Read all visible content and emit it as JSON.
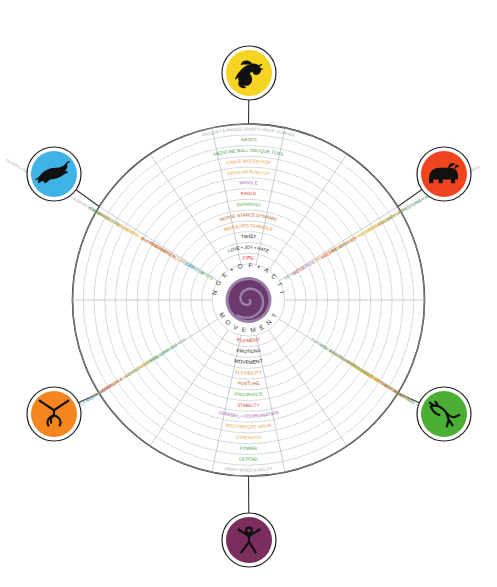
{
  "hub": {
    "top_text": "R A N G E  •  O F  •  A C T I V E",
    "bottom_text": "M O V E M E N T",
    "spiral_color": "#6b3a6b",
    "spiral_outer_color": "#9a7fa8"
  },
  "colors": {
    "grey": "#9aa6ae",
    "green": "#4f9c4f",
    "orange": "#e8a33d",
    "orange_dark": "#e08a2e",
    "purple": "#9b59b6",
    "red": "#d93b2b",
    "green_mid": "#5bb85b",
    "brown": "#b5651d",
    "black": "#222222",
    "yellow": "#e8c83d",
    "teal": "#4aa3a3",
    "blue": "#3d9bd9",
    "ring_line": "#b9c3cc"
  },
  "rings": [
    {
      "index": 0,
      "top": "RACQUET & PADDLE SPORTS • ROCK CLIMBING",
      "bottom": "SPORT SPEED & AGILITY",
      "color": "#9aa6ae",
      "size": 4.0
    },
    {
      "index": 1,
      "top": "AIKIDO",
      "bottom": "DEFEND",
      "color": "#4f9c4f",
      "size": 4.6
    },
    {
      "index": 2,
      "top": "MEDICINE BALL OBLIQUE TOSS",
      "bottom": "POWER",
      "color": "#4f9c4f",
      "size": 4.6
    },
    {
      "index": 3,
      "top": "CABLE WOODCHOP",
      "bottom": "STRENGTH",
      "color": "#e8a33d",
      "size": 4.6
    },
    {
      "index": 4,
      "top": "DRAGON PUSH UP",
      "bottom": "BODYWEIGHT NINJA",
      "color": "#e8a33d",
      "size": 4.6
    },
    {
      "index": 5,
      "top": "WIGGLE",
      "bottom": "CEREBEL • COORDINATION",
      "color": "#9b59b6",
      "size": 4.6
    },
    {
      "index": 6,
      "top": "EAGLE",
      "bottom": "STABILITY",
      "color": "#d93b2b",
      "size": 4.6
    },
    {
      "index": 7,
      "top": "SWIMMING",
      "bottom": "ENDURANCE",
      "color": "#5bb85b",
      "size": 4.6
    },
    {
      "index": 8,
      "top": "HORSE STANCE DYNAMIC",
      "bottom": "POSTURE",
      "color": "#b5651d",
      "size": 4.6
    },
    {
      "index": 9,
      "top": "REVOLVED TRIANGLE",
      "bottom": "FLEXIBILITY",
      "color": "#e08a2e",
      "size": 4.6
    },
    {
      "index": 10,
      "top": "TWIST",
      "bottom": "MOVEMENT",
      "color": "#222222",
      "size": 5.0
    },
    {
      "index": 11,
      "top": "LOVE • JOY • HATE",
      "bottom": "EMOTIONS",
      "color": "#222222",
      "size": 4.6
    },
    {
      "index": 12,
      "top": "FIRE",
      "bottom": "ELEMENT",
      "color": "#d93b2b",
      "size": 5.0
    }
  ],
  "left_spokes": [
    {
      "label": "OLYMPIC / POWER LIFTING • RIFLE SKILLS • JUMPING SPORTS",
      "color": "#9aa6ae"
    },
    {
      "label": "KEY MOVES",
      "color": "#4f9c4f"
    },
    {
      "label": "CLEAN & JERK",
      "color": "#4f9c4f"
    },
    {
      "label": "BARBELL SQUAT",
      "color": "#e8a33d"
    },
    {
      "label": "TUCK JUMPS",
      "color": "#e8a33d"
    },
    {
      "label": "SIDE PLANK",
      "color": "#e8c83d"
    },
    {
      "label": "BURPEE",
      "color": "#d93b2b"
    },
    {
      "label": "CYCLING",
      "color": "#5bb85b"
    },
    {
      "label": "SCORPION",
      "color": "#d93b2b"
    },
    {
      "label": "OVERHEAD SQUAT",
      "color": "#e08a2e"
    },
    {
      "label": "SOAR",
      "color": "#3d9bd9"
    },
    {
      "label": "SADNESS",
      "color": "#4aa3a3"
    },
    {
      "label": "WOOD",
      "color": "#5bb85b"
    }
  ],
  "right_spokes": [
    {
      "label": "OLYMPIC / POWER LIFTING • RIFLE & COMBAT SPORTS",
      "color": "#9aa6ae"
    },
    {
      "label": "KICK • WRESTLING • JU JITSU",
      "color": "#4f9c4f"
    },
    {
      "label": "SNATCH",
      "color": "#4f9c4f"
    },
    {
      "label": "BARBELL DEADLIFT",
      "color": "#e8a33d"
    },
    {
      "label": "MEDICINE BALL",
      "color": "#e8a33d"
    },
    {
      "label": "BEAR WALK",
      "color": "#e8c83d"
    },
    {
      "label": "DANCER",
      "color": "#d93b2b"
    },
    {
      "label": "WALKING",
      "color": "#5bb85b"
    },
    {
      "label": "LOCUST",
      "color": "#d93b2b"
    },
    {
      "label": "TORNADO BEND",
      "color": "#e08a2e"
    },
    {
      "label": "OPEN",
      "color": "#9b59b6"
    },
    {
      "label": "BEND",
      "color": "#d93b2b"
    },
    {
      "label": "METAL",
      "color": "#9aa6ae"
    }
  ],
  "lower_left_spokes": [
    {
      "label": "GENTLE MOVEMENT",
      "color": "#4aa3a3"
    },
    {
      "label": "FEAR • LORDS",
      "color": "#3d9bd9"
    },
    {
      "label": "WARRIOR II",
      "color": "#d93b2b"
    },
    {
      "label": "OPPOSITE ARM & LEG",
      "color": "#e8a33d"
    },
    {
      "label": "ROWING",
      "color": "#5bb85b"
    },
    {
      "label": "SIDE",
      "color": "#e8c83d"
    },
    {
      "label": "MONKEY KICK",
      "color": "#e8a33d"
    },
    {
      "label": "PULL UPS",
      "color": "#4aa3a3"
    },
    {
      "label": "FRONT CLIMBING",
      "color": "#5bb85b"
    },
    {
      "label": "BOXING",
      "color": "#9aa6ae"
    }
  ],
  "lower_right_spokes": [
    {
      "label": "DOUBLE ARM • PUSH LUNGE",
      "color": "#9aa6ae"
    },
    {
      "label": "MARTIAL ARTS",
      "color": "#e08a2e"
    },
    {
      "label": "PRONE COBRA",
      "color": "#d93b2b"
    },
    {
      "label": "SPEED • SKIP • MARATHON",
      "color": "#5bb85b"
    },
    {
      "label": "HANDSTAND",
      "color": "#e8a33d"
    },
    {
      "label": "PISTOL SQUAT DRILL",
      "color": "#e8a33d"
    },
    {
      "label": "BALANCE & ACCURACY",
      "color": "#e8c83d"
    },
    {
      "label": "AGILITY • SPEED DRILLS",
      "color": "#e08a2e"
    },
    {
      "label": "MED BALL SLAM • PUSH UP",
      "color": "#5bb85b"
    },
    {
      "label": "RUNNING & FOOTWORK",
      "color": "#9aa6ae"
    }
  ],
  "badges": [
    {
      "id": "dragon",
      "icon": "dragon-icon",
      "position": "top",
      "fill": "#f5d422",
      "glyph": "dragon"
    },
    {
      "id": "bear",
      "icon": "bear-icon",
      "position": "right-upper",
      "fill": "#f0441f",
      "glyph": "bear"
    },
    {
      "id": "crane",
      "icon": "crane-icon",
      "position": "right-lower",
      "fill": "#4caf35",
      "glyph": "crane"
    },
    {
      "id": "dancer",
      "icon": "dancer-icon",
      "position": "bottom",
      "fill": "#7b2d5e",
      "glyph": "dancer"
    },
    {
      "id": "monkey",
      "icon": "monkey-icon",
      "position": "left-lower",
      "fill": "#f5861f",
      "glyph": "monkey"
    },
    {
      "id": "panther",
      "icon": "panther-icon",
      "position": "left-upper",
      "fill": "#3fb3e8",
      "glyph": "panther"
    }
  ]
}
